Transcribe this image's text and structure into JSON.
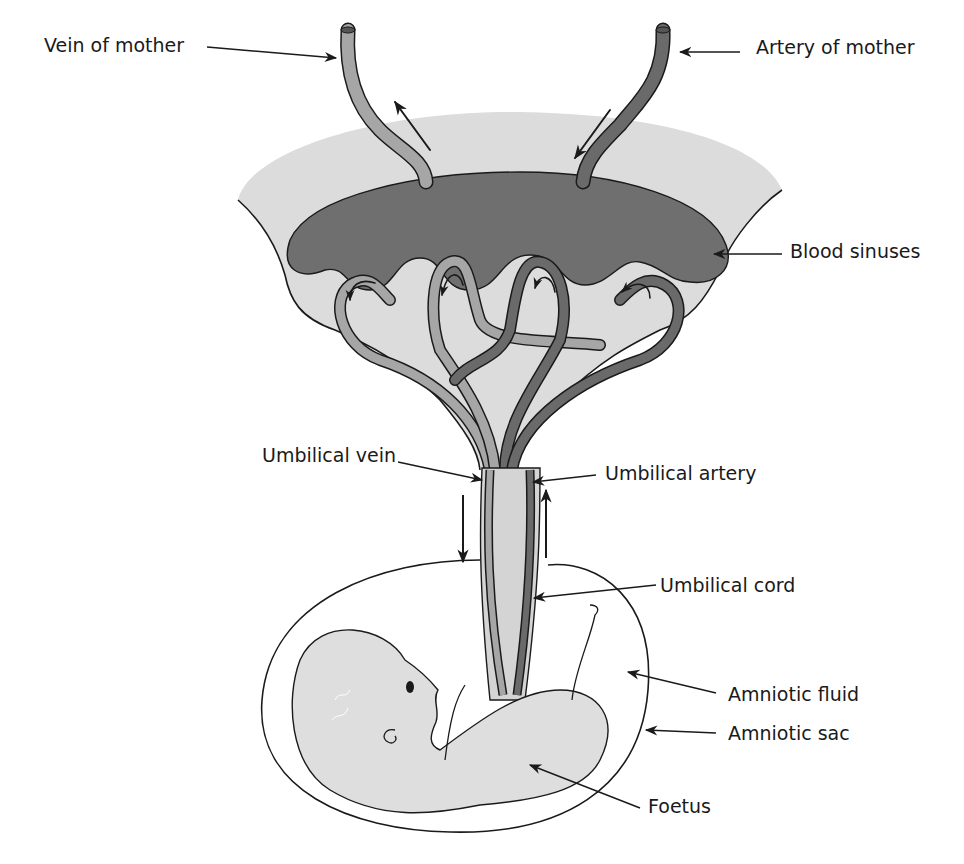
{
  "diagram": {
    "colors": {
      "background": "#ffffff",
      "placenta_tissue": "#dcdcdc",
      "blood_sinus": "#6f6f6f",
      "vein_vessel": "#a6a6a6",
      "artery_vessel": "#6a6a6a",
      "cord_core": "#d4d4d4",
      "foetus": "#dedede",
      "outline": "#1a1a1a"
    },
    "labels": {
      "vein_of_mother": "Vein of mother",
      "artery_of_mother": "Artery of mother",
      "blood_sinuses": "Blood sinuses",
      "umbilical_vein": "Umbilical vein",
      "umbilical_artery": "Umbilical artery",
      "umbilical_cord": "Umbilical cord",
      "amniotic_fluid": "Amniotic fluid",
      "amniotic_sac": "Amniotic sac",
      "foetus": "Foetus"
    }
  }
}
